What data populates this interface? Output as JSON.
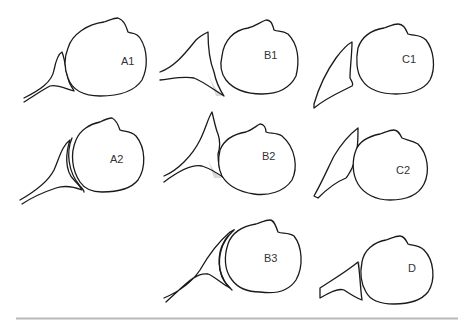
{
  "diagram": {
    "panels": [
      {
        "id": "A1",
        "label": "A1"
      },
      {
        "id": "B1",
        "label": "B1"
      },
      {
        "id": "C1",
        "label": "C1"
      },
      {
        "id": "A2",
        "label": "A2"
      },
      {
        "id": "B2",
        "label": "B2"
      },
      {
        "id": "C2",
        "label": "C2"
      },
      {
        "id": "B3",
        "label": "B3"
      },
      {
        "id": "D",
        "label": "D"
      }
    ],
    "colors": {
      "stroke": "#1a1a1a",
      "label": "#333333",
      "shade": "#d9d9d9",
      "rule": "#b8b8b8"
    }
  }
}
